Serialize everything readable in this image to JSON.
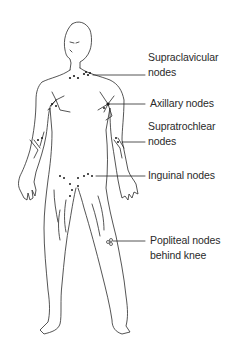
{
  "diagram": {
    "colors": {
      "line": "#2a2a2a",
      "node": "#1a1a1a",
      "background": "#ffffff"
    },
    "labels": [
      {
        "id": "supraclavicular",
        "lines": [
          "Supraclavicular",
          "nodes"
        ]
      },
      {
        "id": "axillary",
        "lines": [
          "Axillary nodes"
        ]
      },
      {
        "id": "supratrochlear",
        "lines": [
          "Supratrochlear",
          "nodes"
        ]
      },
      {
        "id": "inguinal",
        "lines": [
          "Inguinal nodes"
        ]
      },
      {
        "id": "popliteal",
        "lines": [
          "Popliteal nodes",
          "behind knee"
        ]
      }
    ]
  }
}
